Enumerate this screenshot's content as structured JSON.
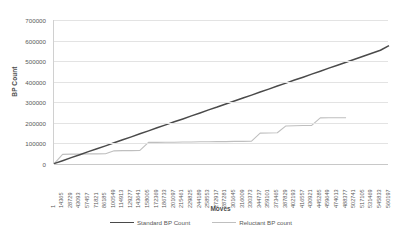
{
  "chart_data": {
    "type": "line",
    "title": "",
    "xlabel": "Moves",
    "ylabel": "BP Count",
    "ylim": [
      0,
      700000
    ],
    "y_ticks": [
      0,
      100000,
      200000,
      300000,
      400000,
      500000,
      600000,
      700000
    ],
    "y_tick_labels": [
      "0",
      "100000",
      "200000",
      "300000",
      "400000",
      "500000",
      "600000",
      "700000"
    ],
    "grid": true,
    "legend_position": "bottom",
    "x_tick_labels": [
      "1",
      "14365",
      "28729",
      "43093",
      "57457",
      "71821",
      "86185",
      "100549",
      "114913",
      "129277",
      "143641",
      "158005",
      "172369",
      "186733",
      "201097",
      "215461",
      "229825",
      "244189",
      "258553",
      "272917",
      "287281",
      "301645",
      "316009",
      "330373",
      "344737",
      "359101",
      "373465",
      "387829",
      "402193",
      "416557",
      "430921",
      "445285",
      "459649",
      "474013",
      "488377",
      "502741",
      "517105",
      "531469",
      "545833",
      "560197"
    ],
    "categories": [
      1,
      14365,
      28729,
      43093,
      57457,
      71821,
      86185,
      100549,
      114913,
      129277,
      143641,
      158005,
      172369,
      186733,
      201097,
      215461,
      229825,
      244189,
      258553,
      272917,
      287281,
      301645,
      316009,
      330373,
      344737,
      359101,
      373465,
      387829,
      402193,
      416557,
      430921,
      445285,
      459649,
      474013,
      488377,
      502741,
      517105,
      531469,
      545833,
      560197
    ],
    "series": [
      {
        "name": "Standard BP Count",
        "color": "#4a4a4a",
        "values": [
          2000,
          16000,
          31000,
          45000,
          60000,
          74000,
          88000,
          103000,
          118000,
          132000,
          147000,
          161000,
          176000,
          190000,
          205000,
          219000,
          234000,
          248000,
          263000,
          277000,
          292000,
          306000,
          321000,
          335000,
          350000,
          364000,
          379000,
          393000,
          408000,
          422000,
          437000,
          451000,
          466000,
          480000,
          495000,
          509000,
          524000,
          538000,
          553000,
          575000
        ]
      },
      {
        "name": "Reluctant BP count",
        "color": "#bfbfbf",
        "values": [
          1000,
          47000,
          48000,
          48000,
          49000,
          49000,
          50000,
          64000,
          65000,
          65000,
          66000,
          105000,
          105000,
          106000,
          106000,
          107000,
          107000,
          108000,
          108000,
          109000,
          109000,
          110000,
          110000,
          111000,
          150000,
          151000,
          152000,
          185000,
          186000,
          187000,
          188000,
          224000,
          225000,
          225000,
          225000,
          null,
          null,
          null,
          null,
          null
        ]
      }
    ]
  },
  "legend": {
    "entries": [
      {
        "label": "Standard BP Count"
      },
      {
        "label": "Reluctant BP count"
      }
    ]
  }
}
